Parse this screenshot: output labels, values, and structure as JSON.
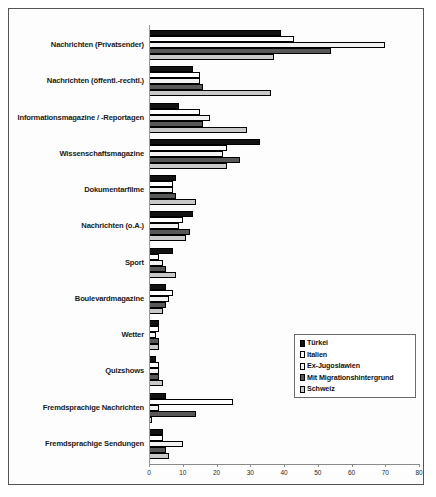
{
  "chart_data": {
    "type": "bar",
    "orientation": "horizontal",
    "title": "",
    "xlabel": "",
    "ylabel": "",
    "xlim": [
      0,
      80
    ],
    "xticks": [
      0,
      10,
      20,
      30,
      40,
      50,
      60,
      70,
      80
    ],
    "grid": false,
    "legend_position": "center-right",
    "categories": [
      "Nachrichten (Privatsender)",
      "Nachrichten (öffentl.-rechtl.)",
      "Informationsmagazine / -Reportagen",
      "Wissenschaftsmagazine",
      "Dokumentarfilme",
      "Nachrichten (o.A.)",
      "Sport",
      "Boulevardmagazine",
      "Wetter",
      "Quizshows",
      "Fremdsprachige Nachrichten",
      "Fremdsprachige Sendungen"
    ],
    "series": [
      {
        "name": "Türkei",
        "color": "#121212",
        "values": [
          39,
          13,
          9,
          33,
          8,
          13,
          7,
          5,
          3,
          2,
          5,
          4
        ]
      },
      {
        "name": "Italien",
        "color": "#ffffff",
        "values": [
          43,
          15,
          15,
          23,
          7,
          10,
          3,
          7,
          3,
          3,
          25,
          4
        ]
      },
      {
        "name": "Ex-Jugoslawien",
        "color": "#f2f2f2",
        "values": [
          70,
          15,
          18,
          22,
          7,
          9,
          4,
          6,
          2,
          3,
          3,
          10
        ]
      },
      {
        "name": "Mit Migrationshintergrund",
        "color": "#585858",
        "values": [
          54,
          16,
          16,
          27,
          8,
          12,
          5,
          5,
          3,
          3,
          14,
          5
        ]
      },
      {
        "name": "Schweiz",
        "color": "#c9c9c9",
        "values": [
          37,
          36,
          29,
          23,
          14,
          11,
          8,
          4,
          3,
          4,
          1,
          6
        ]
      }
    ]
  }
}
